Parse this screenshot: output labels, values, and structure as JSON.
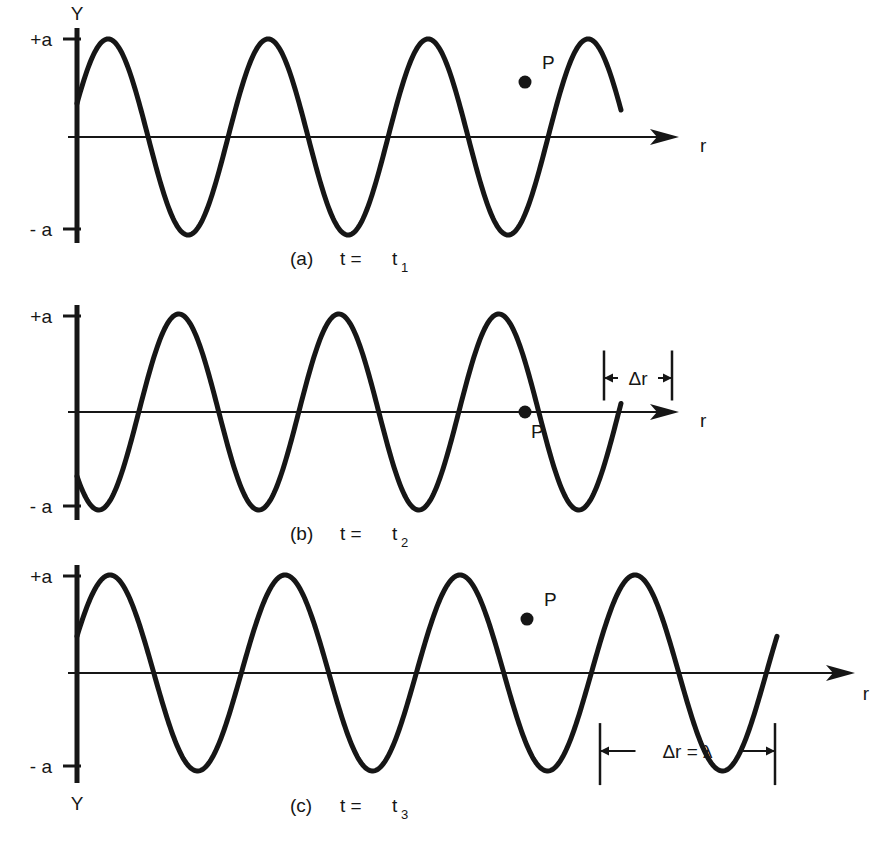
{
  "figure": {
    "stroke_color": "#161616",
    "background": "#ffffff"
  },
  "chart_data": {
    "type": "line",
    "xlabel": "r",
    "ylabel": "Y",
    "grid": false,
    "legend": "none",
    "ylim": [
      -1.35,
      1.35
    ],
    "ytick_labels": [
      "+a",
      "- a"
    ],
    "ytick_values": [
      1,
      -1
    ],
    "panels": [
      {
        "id": "a",
        "caption_prefix": "(a)",
        "caption_text": "t =",
        "caption_var": "t",
        "caption_sub": "1",
        "x_axis_label": "r",
        "y_axis_label": "Y",
        "y_axis_label_position": "top",
        "wavelength_px": 160,
        "phase_deg": 20,
        "cycles": 3.4,
        "amplitude": 1,
        "start_value": 0.34,
        "series_name": "Y(r, t1)",
        "marker": {
          "label": "P",
          "r_px": 525,
          "y_value": 0.56,
          "label_dx": 17,
          "label_dy": -13,
          "on_curve": "descending"
        },
        "dimension": null
      },
      {
        "id": "b",
        "caption_prefix": "(b)",
        "caption_text": "t =",
        "caption_var": "t",
        "caption_sub": "2",
        "x_axis_label": "r",
        "y_axis_label": "Y",
        "y_axis_label_position": "none",
        "wavelength_px": 160,
        "phase_deg": -139,
        "cycles": 3.4,
        "amplitude": 1,
        "start_value": -0.65,
        "series_name": "Y(r, t2)",
        "marker": {
          "label": "P",
          "r_px": 525,
          "y_value": 0.0,
          "label_dx": 6,
          "label_dy": 26,
          "on_curve": "ascending"
        },
        "dimension": {
          "label": "Δr",
          "x_start_px": 604,
          "x_end_px": 672,
          "side": "above",
          "offset_px": 34,
          "extension_px": 50
        }
      },
      {
        "id": "c",
        "caption_prefix": "(c)",
        "caption_text": "t =",
        "caption_var": "t",
        "caption_sub": "3",
        "x_axis_label": "r",
        "y_axis_label": "Y",
        "y_axis_label_position": "bottom",
        "wavelength_px": 175,
        "phase_deg": 22,
        "cycles": 4.0,
        "amplitude": 1,
        "start_value": 0.36,
        "series_name": "Y(r, t3)",
        "marker": {
          "label": "P",
          "r_px": 527,
          "y_value": 0.55,
          "label_dx": 17,
          "label_dy": -13,
          "on_curve": "descending"
        },
        "dimension": {
          "label": "Δr = λ",
          "x_start_px": 600,
          "x_end_px": 775,
          "side": "below",
          "offset_px": 78,
          "extension_px": 62
        }
      }
    ]
  }
}
